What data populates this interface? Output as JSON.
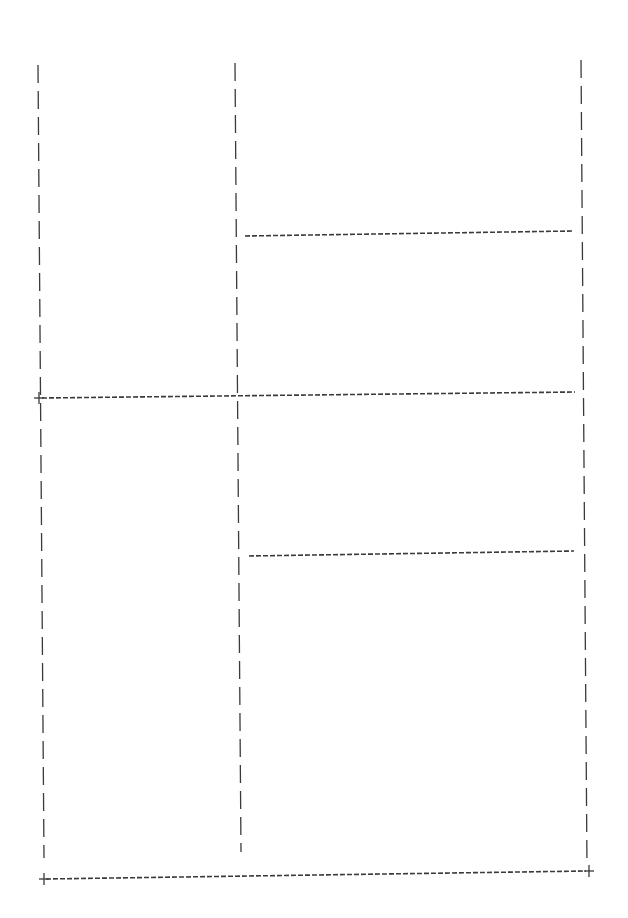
{
  "diagram": {
    "type": "ascii-layout-grid",
    "stroke_color": "#3a3a3a",
    "background": "#ffffff",
    "vertical_lines": [
      {
        "id": "left-border",
        "x1": 38,
        "y1": 65,
        "x2": 44,
        "y2": 858
      },
      {
        "id": "middle-divider",
        "x1": 235,
        "y1": 63,
        "x2": 241,
        "y2": 852
      },
      {
        "id": "right-border",
        "x1": 581,
        "y1": 60,
        "x2": 587,
        "y2": 866
      }
    ],
    "horizontal_lines": [
      {
        "id": "upper-right-divider",
        "x1": 245,
        "y1": 236,
        "x2": 572,
        "y2": 231
      },
      {
        "id": "middle-full-divider",
        "x1": 42,
        "y1": 398,
        "x2": 575,
        "y2": 392
      },
      {
        "id": "lower-right-divider",
        "x1": 249,
        "y1": 556,
        "x2": 574,
        "y2": 551
      },
      {
        "id": "bottom-border",
        "x1": 46,
        "y1": 879,
        "x2": 586,
        "y2": 871
      }
    ],
    "corner_markers": [
      {
        "id": "mid-left-plus",
        "x": 39,
        "y": 398,
        "glyph": "+"
      },
      {
        "id": "bottom-left-plus",
        "x": 44,
        "y": 879,
        "glyph": "+"
      },
      {
        "id": "bottom-right-plus",
        "x": 589,
        "y": 871,
        "glyph": "+"
      }
    ]
  }
}
